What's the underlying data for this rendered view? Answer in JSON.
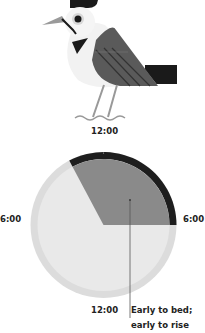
{
  "illustration": {
    "subject": "bird-icon"
  },
  "clock": {
    "top_label": "12:00",
    "left_label": "6:00",
    "right_label": "6:00",
    "bottom_label": "12:00",
    "shaded_segment": {
      "start_deg": -28,
      "end_deg": 90
    }
  },
  "annotation": {
    "line1": "Early to bed;",
    "line2": "early to rise"
  },
  "colors": {
    "outer_ring": "#dcdcdc",
    "inner_disk": "#e9e9e9",
    "wedge": "#8a8a8a",
    "dark_arc": "#1e1e1e",
    "leader_line": "#555555"
  }
}
